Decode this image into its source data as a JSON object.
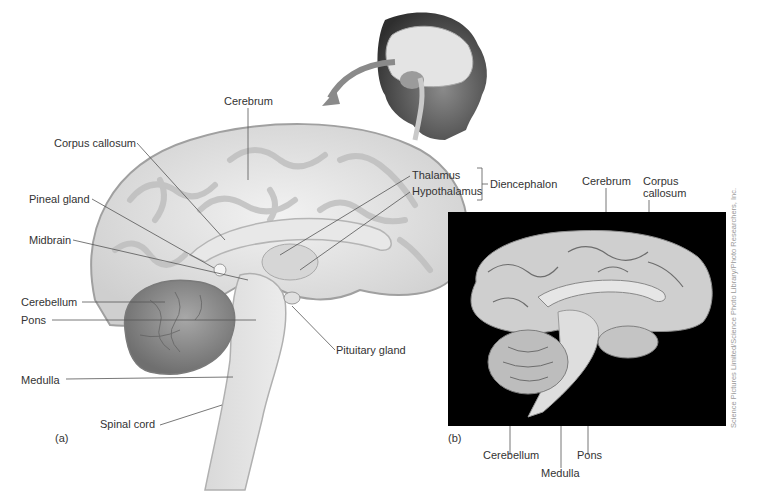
{
  "figure": {
    "panel_a": {
      "letter": "(a)",
      "labels": {
        "cerebrum": "Cerebrum",
        "corpus_callosum": "Corpus callosum",
        "pineal_gland": "Pineal gland",
        "midbrain": "Midbrain",
        "cerebellum": "Cerebellum",
        "pons": "Pons",
        "medulla": "Medulla",
        "spinal_cord": "Spinal cord",
        "thalamus": "Thalamus",
        "hypothalamus": "Hypothalamus",
        "diencephalon": "Diencephalon",
        "pituitary_gland": "Pituitary gland"
      }
    },
    "panel_b": {
      "letter": "(b)",
      "labels": {
        "cerebrum": "Cerebrum",
        "corpus_callosum_line1": "Corpus",
        "corpus_callosum_line2": "callosum",
        "cerebellum": "Cerebellum",
        "medulla": "Medulla",
        "pons": "Pons"
      },
      "credit": "Science Pictures Limited/Science Photo Library/Photo Researchers, Inc."
    },
    "inset": {
      "description": "head-profile-with-brain-inset"
    },
    "colors": {
      "brain_light": "#e6e6e6",
      "brain_mid": "#c8c8c8",
      "brain_dark": "#8c8c8c",
      "leader_line": "#555555",
      "photo_bg": "#000000"
    }
  }
}
